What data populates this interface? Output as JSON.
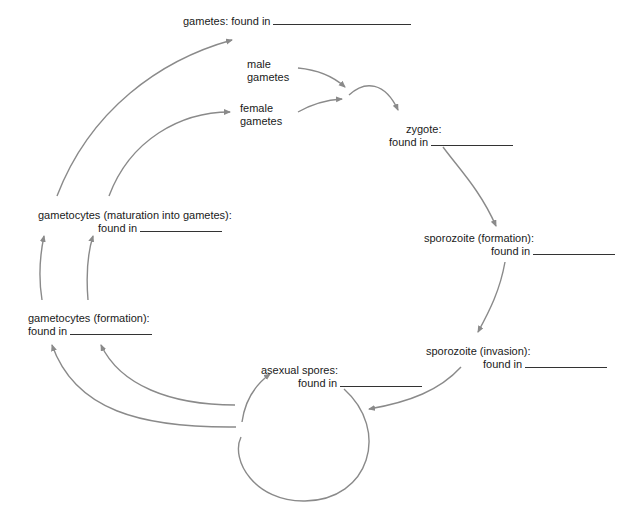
{
  "diagram": {
    "title": "gametes: found in",
    "arrow_color": "#8a8a8a",
    "text_color": "#1a1a1a",
    "nodes": {
      "male_gametes": {
        "line1": "male",
        "line2": "gametes"
      },
      "female_gametes": {
        "line1": "female",
        "line2": "gametes"
      },
      "zygote": {
        "line1": "zygote:",
        "line2": "found in"
      },
      "sporozoite_formation": {
        "line1": "sporozoite (formation):",
        "line2": "found in"
      },
      "sporozoite_invasion": {
        "line1": "sporozoite (invasion):",
        "line2": "found in"
      },
      "asexual_spores": {
        "line1": "asexual spores:",
        "line2": "found in"
      },
      "gametocytes_formation": {
        "line1": "gametocytes (formation):",
        "line2": "found in"
      },
      "gametocytes_maturation": {
        "line1": "gametocytes (maturation into gametes):",
        "line2": "found in"
      }
    },
    "edges": [
      {
        "from": "male_gametes",
        "to": "zygote"
      },
      {
        "from": "female_gametes",
        "to": "zygote"
      },
      {
        "from": "zygote",
        "to": "sporozoite_formation"
      },
      {
        "from": "sporozoite_formation",
        "to": "sporozoite_invasion"
      },
      {
        "from": "sporozoite_invasion",
        "to": "asexual_spores"
      },
      {
        "from": "asexual_spores",
        "to": "asexual_spores"
      },
      {
        "from": "asexual_spores",
        "to": "gametocytes_formation"
      },
      {
        "from": "gametocytes_formation",
        "to": "gametocytes_maturation"
      },
      {
        "from": "gametocytes_maturation",
        "to": "male_gametes"
      },
      {
        "from": "gametocytes_maturation",
        "to": "female_gametes"
      }
    ]
  }
}
